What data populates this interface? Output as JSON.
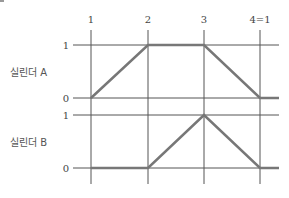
{
  "diagram": {
    "type": "displacement-step-diagram",
    "steps": [
      "1",
      "2",
      "3",
      "4=1"
    ],
    "cylinders": [
      {
        "name": "실린더 A",
        "levels": {
          "high": "1",
          "low": "0"
        },
        "path": [
          0,
          1,
          1,
          0,
          0
        ]
      },
      {
        "name": "실린더 B",
        "levels": {
          "high": "1",
          "low": "0"
        },
        "path": [
          0,
          0,
          1,
          0,
          0
        ]
      }
    ]
  },
  "colors": {
    "grid": "#555555",
    "trace": "#777777"
  }
}
